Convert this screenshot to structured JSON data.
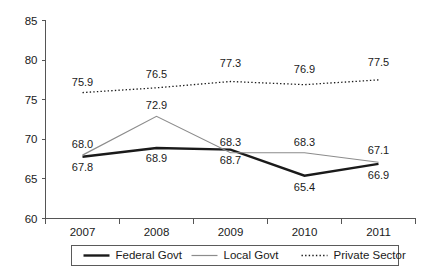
{
  "chart_data": {
    "type": "line",
    "title": "",
    "xlabel": "",
    "ylabel": "",
    "categories": [
      "2007",
      "2008",
      "2009",
      "2010",
      "2011"
    ],
    "ylim": [
      60,
      85
    ],
    "yticks": [
      60,
      65,
      70,
      75,
      80,
      85
    ],
    "ytick_labels": [
      "60",
      "65",
      "70",
      "75",
      "80",
      "85"
    ],
    "grid": false,
    "legend_position": "bottom",
    "series": [
      {
        "name": "Federal Govt",
        "values": [
          67.8,
          68.9,
          68.7,
          65.4,
          66.9
        ],
        "labels": [
          "67.8",
          "68.9",
          "68.7",
          "65.4",
          "66.9"
        ],
        "color": "#1a1a1a",
        "width": 2.4,
        "dash": "none",
        "style": "solid-thick",
        "label_offsets": [
          14,
          14,
          14,
          15,
          15
        ]
      },
      {
        "name": "Local Govt",
        "values": [
          68.0,
          72.9,
          68.3,
          68.3,
          67.1
        ],
        "labels": [
          "68.0",
          "72.9",
          "68.3",
          "68.3",
          "67.1"
        ],
        "color": "#8c8c8c",
        "width": 1.2,
        "dash": "none",
        "style": "solid-thin",
        "label_offsets": [
          -7,
          -7,
          -7,
          -7,
          -8
        ]
      },
      {
        "name": "Private Sector",
        "values": [
          75.9,
          76.5,
          77.3,
          76.9,
          77.5
        ],
        "labels": [
          "75.9",
          "76.5",
          "77.3",
          "76.9",
          "77.5"
        ],
        "color": "#1a1a1a",
        "width": 1.3,
        "dash": "1.4,2.2",
        "style": "dotted",
        "label_offsets": [
          -7,
          -10,
          -14,
          -12,
          -14
        ]
      }
    ]
  },
  "legend": {
    "items": [
      {
        "label": "Federal Govt"
      },
      {
        "label": "Local Govt"
      },
      {
        "label": "Private Sector"
      }
    ]
  }
}
